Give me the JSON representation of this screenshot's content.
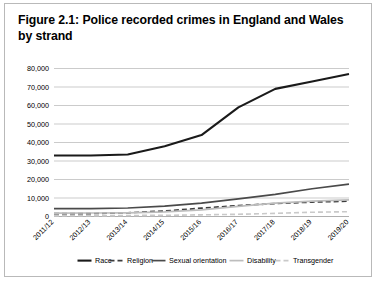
{
  "figure": {
    "title": "Figure 2.1: Police recorded crimes in England and Wales by strand"
  },
  "chart_data": {
    "type": "line",
    "title": "Figure 2.1: Police recorded crimes in England and Wales by strand",
    "xlabel": "",
    "ylabel": "",
    "categories": [
      "2011/12",
      "2012/13",
      "2013/14",
      "2014/15",
      "2015/16",
      "2016/17",
      "2017/18",
      "2018/19",
      "2019/20"
    ],
    "ylim": [
      0,
      80000
    ],
    "ytick_labels": [
      "0",
      "10,000",
      "20,000",
      "30,000",
      "40,000",
      "50,000",
      "60,000",
      "70,000",
      "80,000"
    ],
    "ytick_values": [
      0,
      10000,
      20000,
      30000,
      40000,
      50000,
      60000,
      70000,
      80000
    ],
    "grid": true,
    "legend_position": "bottom",
    "series": [
      {
        "name": "Race",
        "style": "solid-thick",
        "color": "#1a1a1a",
        "values": [
          33000,
          33000,
          33500,
          38000,
          44000,
          59000,
          69000,
          73000,
          77000
        ]
      },
      {
        "name": "Religion",
        "style": "dashed",
        "color": "#3d3d3d",
        "values": [
          1500,
          1600,
          2000,
          3000,
          4500,
          5900,
          7000,
          7800,
          8300
        ]
      },
      {
        "name": "Sexual orientation",
        "style": "solid",
        "color": "#4a4a4a",
        "values": [
          4300,
          4300,
          4600,
          5600,
          7200,
          9500,
          12000,
          15000,
          17500
        ]
      },
      {
        "name": "Disability",
        "style": "solid-light",
        "color": "#bdbdbd",
        "values": [
          1800,
          1900,
          2000,
          2500,
          3600,
          5500,
          7200,
          8300,
          9000
        ]
      },
      {
        "name": "Transgender",
        "style": "dashed-light",
        "color": "#c9c9c9",
        "values": [
          350,
          400,
          550,
          650,
          900,
          1200,
          1700,
          2300,
          2600
        ]
      }
    ]
  },
  "legend": {
    "items": [
      {
        "label": "Race"
      },
      {
        "label": "Religion"
      },
      {
        "label": "Sexual orientation"
      },
      {
        "label": "Disability"
      },
      {
        "label": "Transgender"
      }
    ]
  }
}
